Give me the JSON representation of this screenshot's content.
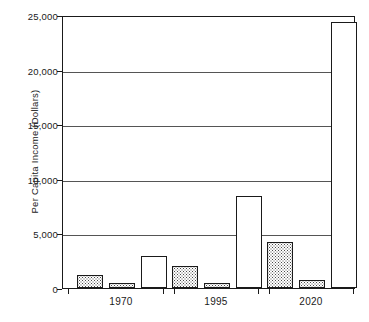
{
  "chart_data": {
    "type": "bar",
    "title": "",
    "subtitle": "",
    "xlabel": "",
    "ylabel": "Per Capita Income (Dollars)",
    "categories": [
      "1970",
      "1995",
      "2020"
    ],
    "ylim": [
      0,
      25000
    ],
    "yticks": [
      0,
      5000,
      10000,
      15000,
      20000,
      25000
    ],
    "ytick_labels": [
      "0",
      "5,000",
      "10,000",
      "15,000",
      "20,000",
      "25,000"
    ],
    "grid": true,
    "legend": "none",
    "series": [
      {
        "name": "series-1",
        "fill": "stipple",
        "values": [
          1150,
          2000,
          4250
        ]
      },
      {
        "name": "series-2",
        "fill": "stipple",
        "values": [
          450,
          500,
          700
        ]
      },
      {
        "name": "series-3",
        "fill": "open",
        "values": [
          2950,
          8400,
          24400
        ]
      }
    ],
    "colors": {
      "axis": "#1a1a1a",
      "gridline": "#555555",
      "bar_outline": "#1a1a1a",
      "bar_open_fill": "#ffffff",
      "bar_stipple_dot": "#4a4a4a",
      "background": "#ffffff"
    }
  }
}
